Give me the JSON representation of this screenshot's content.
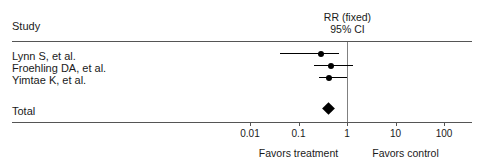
{
  "figure": {
    "title": "",
    "study_column_header": "Study",
    "effect_header_line1": "RR (fixed)",
    "effect_header_line2": "95% CI",
    "total_label": "Total",
    "favors_left": "Favors treatment",
    "favors_right": "Favors control",
    "colors": {
      "marker": "#000000",
      "rule": "#555555",
      "null_line": "#808080",
      "text": "#1a1a1a",
      "background": "#ffffff"
    }
  },
  "chart_data": {
    "type": "forest",
    "title": "",
    "xlabel": "",
    "ylabel": "",
    "scale": "log",
    "effect_measure": "RR (fixed)",
    "ci_level": "95% CI",
    "null_value": 1,
    "xlim": [
      0.01,
      100
    ],
    "tick_values": [
      0.01,
      0.1,
      1,
      10,
      100
    ],
    "tick_labels": [
      "0.01",
      "0.1",
      "1",
      "10",
      "100"
    ],
    "grid": false,
    "legend": "none",
    "axis_annotations": {
      "left": "Favors treatment",
      "right": "Favors control"
    },
    "categories": [
      "Lynn S, et al.",
      "Froehling DA, et al.",
      "Yimtae K, et al.",
      "Total"
    ],
    "studies": [
      {
        "label": "Lynn S, et al.",
        "estimate": 0.29,
        "ci_low": 0.041,
        "ci_high": 0.68,
        "marker": "square"
      },
      {
        "label": "Froehling DA, et al.",
        "estimate": 0.46,
        "ci_low": 0.21,
        "ci_high": 1.3,
        "marker": "square"
      },
      {
        "label": "Yimtae K, et al.",
        "estimate": 0.43,
        "ci_low": 0.26,
        "ci_high": 1.0,
        "marker": "square"
      }
    ],
    "summary": {
      "label": "Total",
      "estimate": 0.42,
      "ci_low": 0.3,
      "ci_high": 0.6,
      "marker": "diamond"
    }
  }
}
